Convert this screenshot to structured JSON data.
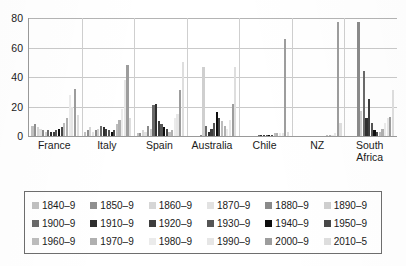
{
  "chart_data": {
    "type": "bar",
    "title": "",
    "subtitle": "",
    "xlabel": "",
    "ylabel": "",
    "ylim": [
      0,
      80
    ],
    "yticks": [
      0,
      20,
      40,
      60,
      80
    ],
    "grid": true,
    "legend_position": "bottom",
    "categories": [
      "France",
      "Italy",
      "Spain",
      "Australia",
      "Chile",
      "NZ",
      "South\nAfrica"
    ],
    "series": [
      {
        "name": "1840–9",
        "color": "#c0c0c0",
        "values": [
          7,
          3,
          2,
          0,
          0,
          0,
          0
        ]
      },
      {
        "name": "1850–9",
        "color": "#8f8f8f",
        "values": [
          8,
          4,
          2,
          0,
          0,
          0,
          0
        ]
      },
      {
        "name": "1860–9",
        "color": "#d6d6d6",
        "values": [
          6,
          6,
          4,
          0,
          0,
          0,
          0
        ]
      },
      {
        "name": "1870–9",
        "color": "#e2e2e2",
        "values": [
          5,
          3,
          3,
          0,
          0,
          0,
          0
        ]
      },
      {
        "name": "1880–9",
        "color": "#8a8a8a",
        "values": [
          4,
          4,
          7,
          1,
          0,
          0,
          77
        ]
      },
      {
        "name": "1890–9",
        "color": "#cfcfcf",
        "values": [
          3,
          5,
          5,
          47,
          0,
          0,
          17
        ]
      },
      {
        "name": "1900–9",
        "color": "#6a6a6a",
        "values": [
          4,
          7,
          21,
          7,
          1,
          0,
          44
        ]
      },
      {
        "name": "1910–9",
        "color": "#2e2e2e",
        "values": [
          3,
          6,
          22,
          3,
          1,
          0,
          12
        ]
      },
      {
        "name": "1920–9",
        "color": "#3d3d3d",
        "values": [
          3,
          5,
          10,
          5,
          1,
          0,
          25
        ]
      },
      {
        "name": "1930–9",
        "color": "#555555",
        "values": [
          4,
          4,
          8,
          9,
          1,
          0,
          9
        ]
      },
      {
        "name": "1940–9",
        "color": "#0d0d0d",
        "values": [
          5,
          3,
          6,
          16,
          1,
          0,
          4
        ]
      },
      {
        "name": "1950–9",
        "color": "#474747",
        "values": [
          6,
          4,
          5,
          12,
          1,
          0,
          3
        ]
      },
      {
        "name": "1960–9",
        "color": "#bdbdbd",
        "values": [
          9,
          8,
          3,
          10,
          2,
          1,
          3
        ]
      },
      {
        "name": "1970–9",
        "color": "#b0b0b0",
        "values": [
          12,
          11,
          4,
          7,
          2,
          1,
          5
        ]
      },
      {
        "name": "1980–9",
        "color": "#ebebeb",
        "values": [
          28,
          18,
          12,
          5,
          2,
          1,
          9
        ]
      },
      {
        "name": "1990–9",
        "color": "#e6e6e6",
        "values": [
          20,
          38,
          15,
          11,
          2,
          2,
          12
        ]
      },
      {
        "name": "2000–9",
        "color": "#9d9d9d",
        "values": [
          32,
          48,
          31,
          22,
          66,
          77,
          13
        ]
      },
      {
        "name": "2010–5",
        "color": "#dedede",
        "values": [
          14,
          12,
          50,
          47,
          3,
          9,
          31
        ]
      }
    ]
  },
  "axis": {
    "yticks": [
      "0",
      "20",
      "40",
      "60",
      "80"
    ]
  },
  "legend": {
    "items": [
      {
        "label": "1840–9",
        "color": "#c0c0c0"
      },
      {
        "label": "1850–9",
        "color": "#8f8f8f"
      },
      {
        "label": "1860–9",
        "color": "#d6d6d6"
      },
      {
        "label": "1870–9",
        "color": "#e2e2e2"
      },
      {
        "label": "1880–9",
        "color": "#8a8a8a"
      },
      {
        "label": "1890–9",
        "color": "#cfcfcf"
      },
      {
        "label": "1900–9",
        "color": "#6a6a6a"
      },
      {
        "label": "1910–9",
        "color": "#2e2e2e"
      },
      {
        "label": "1920–9",
        "color": "#3d3d3d"
      },
      {
        "label": "1930–9",
        "color": "#555555"
      },
      {
        "label": "1940–9",
        "color": "#0d0d0d"
      },
      {
        "label": "1950–9",
        "color": "#474747"
      },
      {
        "label": "1960–9",
        "color": "#bdbdbd"
      },
      {
        "label": "1970–9",
        "color": "#b0b0b0"
      },
      {
        "label": "1980–9",
        "color": "#ebebeb"
      },
      {
        "label": "1990–9",
        "color": "#e6e6e6"
      },
      {
        "label": "2000–9",
        "color": "#9d9d9d"
      },
      {
        "label": "2010–5",
        "color": "#dedede"
      }
    ]
  }
}
